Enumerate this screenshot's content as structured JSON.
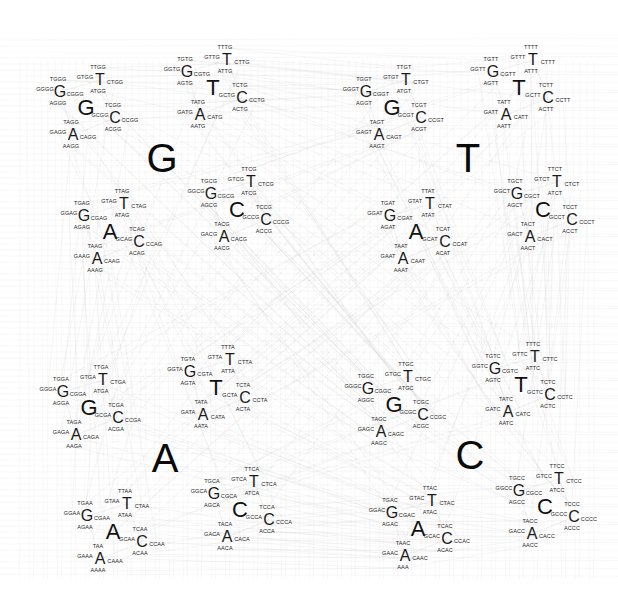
{
  "diagram": {
    "title": "",
    "alphabet": [
      "G",
      "T",
      "C",
      "A"
    ],
    "line_color": "#c8c8c8",
    "text_color": "#111111",
    "quadrants": [
      {
        "letter": "G",
        "center": [
          162,
          158
        ]
      },
      {
        "letter": "T",
        "center": [
          468,
          158
        ]
      },
      {
        "letter": "A",
        "center": [
          165,
          458
        ]
      },
      {
        "letter": "C",
        "center": [
          470,
          455
        ]
      }
    ],
    "offsets": {
      "level1": {
        "G": [
          -76,
          -50
        ],
        "T": [
          51,
          -70
        ],
        "C": [
          75,
          52
        ],
        "A": [
          -52,
          74
        ]
      },
      "level2": {
        "G": [
          -26,
          -16
        ],
        "T": [
          14,
          -28
        ],
        "C": [
          29,
          10
        ],
        "A": [
          -13,
          27
        ]
      },
      "level3": {
        "G": [
          -15,
          -2
        ],
        "T": [
          -2,
          -12
        ],
        "C": [
          15,
          3
        ],
        "A": [
          -2,
          12
        ]
      }
    },
    "label_overrides": {
      "AAAC": "AAA",
      "TAAA": "TAA"
    },
    "kmers_shown": [
      "TTGG",
      "TGGG",
      "GTGG",
      "CTGG",
      "GGGG",
      "CGGG",
      "ATGG",
      "AGGG",
      "TCGG",
      "TAGG",
      "GCGG",
      "CCGG",
      "GAGG",
      "CAGG",
      "ACGG",
      "AAGG",
      "TTTG",
      "TGTG",
      "GTTG",
      "CTTG",
      "GGTG",
      "CGTG",
      "ATTG",
      "AGTG",
      "TCTG",
      "TATG",
      "GCTG",
      "CCTG",
      "GATG",
      "CATG",
      "ACTG",
      "AATG",
      "TTAG",
      "TGAG",
      "GTAG",
      "CTAG",
      "GGAG",
      "CGAG",
      "ATAG",
      "AGAG",
      "TCAG",
      "TAAG",
      "GCAG",
      "CCAG",
      "GAAG",
      "CAAG",
      "ACAG",
      "AAAG",
      "TTCG",
      "TGCG",
      "GTCG",
      "CTCG",
      "GGCG",
      "CGCG",
      "ATCG",
      "AGCG",
      "TCCG",
      "TACG",
      "GCCG",
      "CCCG",
      "GACG",
      "CACG",
      "ACCG",
      "AACG",
      "TTGT",
      "TGGT",
      "GTGT",
      "CTGT",
      "GGGT",
      "CGGT",
      "ATGT",
      "AGGT",
      "TCGT",
      "TAGT",
      "GCGT",
      "CCGT",
      "GAGT",
      "CAGT",
      "ACGT",
      "AAGT",
      "TTTT",
      "TGTT",
      "GTTT",
      "CTTT",
      "GGTT",
      "CGTT",
      "ATTT",
      "AGTT",
      "TCTT",
      "TATT",
      "GCTT",
      "CCTT",
      "GATT",
      "CATT",
      "ACTT",
      "AATT",
      "TTAT",
      "TGAT",
      "GTAT",
      "CTAT",
      "GGAT",
      "CGAT",
      "ATAT",
      "AGAT",
      "TCAT",
      "TAAT",
      "GCAT",
      "CCAT",
      "GAAT",
      "CAAT",
      "ACAT",
      "AAAT",
      "TTCT",
      "TGCT",
      "GTCT",
      "CTCT",
      "GGCT",
      "CGCT",
      "ATCT",
      "AGCT",
      "TCCT",
      "TACT",
      "GCCT",
      "CCCT",
      "GACT",
      "CACT",
      "ACCT",
      "AACT",
      "TTGA",
      "TGGA",
      "GTGA",
      "CTGA",
      "GGGA",
      "CGGA",
      "ATGA",
      "AGGA",
      "TCGA",
      "TAGA",
      "GCGA",
      "CCGA",
      "GAGA",
      "CAGA",
      "ACGA",
      "AAGA",
      "TTTA",
      "TGTA",
      "GTTA",
      "CTTA",
      "GGTA",
      "CGTA",
      "ATTA",
      "AGTA",
      "TCTA",
      "TATA",
      "GCTA",
      "CCTA",
      "GATA",
      "CATA",
      "ACTA",
      "AATA",
      "TTAA",
      "TGAA",
      "GTAA",
      "CTAA",
      "GGAA",
      "CGAA",
      "ATAA",
      "AGAA",
      "TCAA",
      "TAA",
      "GCAA",
      "CCAA",
      "GAAA",
      "CAAA",
      "ACAA",
      "AAAA",
      "TTCA",
      "TGCA",
      "GTCA",
      "CTCA",
      "GGCA",
      "CGCA",
      "ATCA",
      "AGCA",
      "TCCA",
      "TACA",
      "GCCA",
      "CCCA",
      "GACA",
      "CACA",
      "ACCA",
      "AACA",
      "TTGC",
      "TGGC",
      "GTGC",
      "CTGC",
      "GGGC",
      "CGGC",
      "ATGC",
      "AGGC",
      "TCGC",
      "TAGC",
      "GCGC",
      "CCGC",
      "GAGC",
      "CAGC",
      "ACGC",
      "AAGC",
      "TTTC",
      "TGTC",
      "GTTC",
      "CTTC",
      "GGTC",
      "CGTC",
      "ATTC",
      "AGTC",
      "TCTC",
      "TATC",
      "GCTC",
      "CCTC",
      "GATC",
      "CATC",
      "ACTC",
      "AATC",
      "TTAC",
      "TGAC",
      "GTAC",
      "CTAC",
      "GGAC",
      "CGAC",
      "ATAC",
      "AGAC",
      "TCAC",
      "TAAC",
      "GCAC",
      "CCAC",
      "GAAC",
      "CAAC",
      "ACAC",
      "AAA",
      "TTCC",
      "TGCC",
      "GTCC",
      "CTCC",
      "GGCC",
      "CGCC",
      "ATCC",
      "AGCC",
      "TCCC",
      "TACC",
      "GCCC",
      "CCCC",
      "GACC",
      "CACC",
      "ACCC",
      "AACC"
    ]
  }
}
